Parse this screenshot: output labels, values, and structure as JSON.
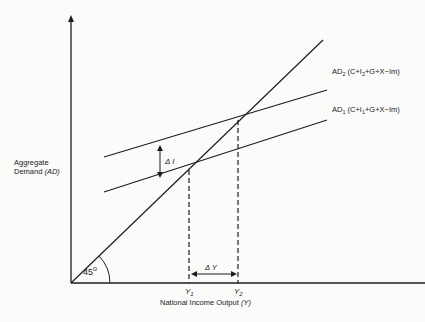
{
  "diagram": {
    "type": "keynesian-cross",
    "colors": {
      "line": "#1e1e1e",
      "background": "#fbfbfa",
      "text": "#222222"
    },
    "y_axis": {
      "label_line1": "Aggregate",
      "label_line2": "Demand",
      "label_symbol": "(AD)"
    },
    "x_axis": {
      "label": "National Income Output",
      "label_symbol": "(Y)"
    },
    "angle_label": "45",
    "angle_unit": "o",
    "curves": [
      {
        "id": "AD2",
        "label_main": "AD",
        "label_sub": "2",
        "label_expr_a": "(C+I",
        "label_expr_sub": "2",
        "label_expr_b": "+G+X−Im)"
      },
      {
        "id": "AD1",
        "label_main": "AD",
        "label_sub": "1",
        "label_expr_a": "(C+I",
        "label_expr_sub": "1",
        "label_expr_b": "+G+X−Im)"
      }
    ],
    "delta_I_label": "Δ I",
    "delta_Y_label": "Δ Y",
    "y1_label": "Y",
    "y1_sub": "1",
    "y2_label": "Y",
    "y2_sub": "2"
  }
}
